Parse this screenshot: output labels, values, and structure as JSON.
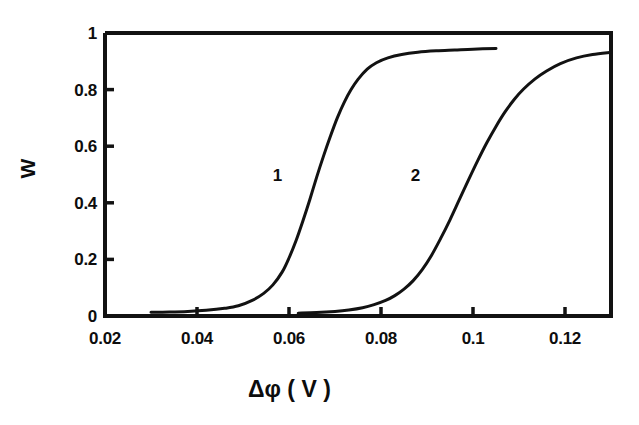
{
  "chart_data": {
    "type": "line",
    "title": "",
    "subtitle": "",
    "xlabel": "Δφ ( V )",
    "ylabel": "W",
    "xlim": [
      0.02,
      0.13
    ],
    "ylim": [
      0,
      1
    ],
    "grid": false,
    "legend_position": "inline-curve-labels",
    "annotations": [
      {
        "text": "1",
        "x": 0.0575,
        "y": 0.5
      },
      {
        "text": "2",
        "x": 0.0875,
        "y": 0.5
      }
    ],
    "xticks": [
      0.02,
      0.04,
      0.06,
      0.08,
      0.1,
      0.12
    ],
    "xtick_labels": [
      "0.02",
      "0.04",
      "0.06",
      "0.08",
      "0.1",
      "0.12"
    ],
    "yticks": [
      0,
      0.2,
      0.4,
      0.6,
      0.8,
      1
    ],
    "ytick_labels": [
      "0",
      "0.2",
      "0.4",
      "0.6",
      "0.8",
      "1"
    ],
    "series": [
      {
        "name": "1",
        "x": [
          0.03,
          0.034,
          0.038,
          0.042,
          0.046,
          0.049,
          0.052,
          0.0545,
          0.0565,
          0.0585,
          0.06,
          0.0615,
          0.063,
          0.0645,
          0.066,
          0.0675,
          0.069,
          0.0705,
          0.072,
          0.0735,
          0.075,
          0.077,
          0.079,
          0.0815,
          0.0845,
          0.088,
          0.092,
          0.096,
          0.1,
          0.105
        ],
        "values": [
          0.013,
          0.014,
          0.016,
          0.02,
          0.027,
          0.036,
          0.055,
          0.08,
          0.11,
          0.155,
          0.205,
          0.265,
          0.335,
          0.41,
          0.49,
          0.565,
          0.635,
          0.7,
          0.755,
          0.8,
          0.836,
          0.872,
          0.895,
          0.912,
          0.924,
          0.932,
          0.937,
          0.94,
          0.943,
          0.945
        ]
      },
      {
        "name": "2",
        "x": [
          0.062,
          0.066,
          0.07,
          0.073,
          0.076,
          0.0785,
          0.081,
          0.083,
          0.085,
          0.087,
          0.089,
          0.091,
          0.093,
          0.095,
          0.097,
          0.099,
          0.101,
          0.103,
          0.105,
          0.107,
          0.109,
          0.111,
          0.1135,
          0.116,
          0.119,
          0.1225,
          0.126,
          0.13
        ],
        "values": [
          0.01,
          0.012,
          0.016,
          0.021,
          0.029,
          0.04,
          0.055,
          0.072,
          0.095,
          0.125,
          0.165,
          0.215,
          0.275,
          0.34,
          0.41,
          0.48,
          0.548,
          0.612,
          0.67,
          0.722,
          0.766,
          0.802,
          0.838,
          0.866,
          0.892,
          0.912,
          0.924,
          0.932
        ]
      }
    ],
    "style": {
      "line_color": "#121212",
      "axis_color": "#121212",
      "background": "#ffffff",
      "line_width": 3.0,
      "axis_width": 4.0
    },
    "axes_box": {
      "left_value": 0.02,
      "right_value": 0.13,
      "bottom_value": 0,
      "top_value": 1
    }
  }
}
